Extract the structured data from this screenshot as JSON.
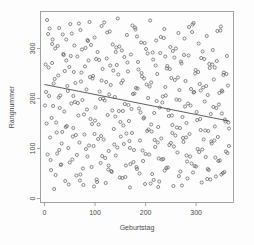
{
  "chart_data": {
    "type": "scatter",
    "title": "",
    "xlabel": "Geburtstag",
    "ylabel": "Rangnummer",
    "xlim": [
      -8,
      374
    ],
    "ylim": [
      -8,
      374
    ],
    "xticks": [
      0,
      100,
      200,
      300
    ],
    "xtick_labels": [
      "0",
      "100",
      "200",
      "300"
    ],
    "yticks": [
      0,
      100,
      200,
      300
    ],
    "ytick_labels": [
      "0",
      "100",
      "200",
      "300"
    ],
    "grid": false,
    "legend": null,
    "marker": "open-circle",
    "marker_color": "#5a5a5a",
    "frame_color": "#8c8c8c",
    "background_color": "#fdfdfd",
    "trend": {
      "type": "linear-regression",
      "color": "#4d4d4d",
      "x_start": 0,
      "y_start": 228,
      "x_end": 365,
      "y_end": 155,
      "slope": -0.2,
      "intercept": 228
    },
    "n_points": 366,
    "points": [
      [
        3,
        213
      ],
      [
        5,
        357
      ],
      [
        7,
        329
      ],
      [
        9,
        205
      ],
      [
        11,
        122
      ],
      [
        13,
        57
      ],
      [
        15,
        271
      ],
      [
        17,
        185
      ],
      [
        19,
        19
      ],
      [
        21,
        300
      ],
      [
        23,
        152
      ],
      [
        25,
        90
      ],
      [
        27,
        246
      ],
      [
        29,
        341
      ],
      [
        31,
        206
      ],
      [
        33,
        68
      ],
      [
        35,
        133
      ],
      [
        37,
        289
      ],
      [
        39,
        174
      ],
      [
        41,
        35
      ],
      [
        43,
        318
      ],
      [
        45,
        225
      ],
      [
        47,
        101
      ],
      [
        49,
        263
      ],
      [
        51,
        349
      ],
      [
        53,
        190
      ],
      [
        55,
        78
      ],
      [
        57,
        141
      ],
      [
        59,
        306
      ],
      [
        61,
        231
      ],
      [
        63,
        46
      ],
      [
        65,
        284
      ],
      [
        67,
        166
      ],
      [
        69,
        112
      ],
      [
        71,
        337
      ],
      [
        73,
        252
      ],
      [
        75,
        197
      ],
      [
        77,
        27
      ],
      [
        79,
        128
      ],
      [
        81,
        301
      ],
      [
        83,
        218
      ],
      [
        85,
        84
      ],
      [
        87,
        276
      ],
      [
        89,
        353
      ],
      [
        91,
        159
      ],
      [
        93,
        63
      ],
      [
        95,
        240
      ],
      [
        97,
        105
      ],
      [
        99,
        322
      ],
      [
        101,
        182
      ],
      [
        103,
        38
      ],
      [
        105,
        293
      ],
      [
        107,
        148
      ],
      [
        109,
        214
      ],
      [
        111,
        71
      ],
      [
        113,
        345
      ],
      [
        115,
        259
      ],
      [
        117,
        118
      ],
      [
        119,
        196
      ],
      [
        121,
        31
      ],
      [
        123,
        280
      ],
      [
        125,
        167
      ],
      [
        127,
        95
      ],
      [
        129,
        334
      ],
      [
        131,
        227
      ],
      [
        133,
        53
      ],
      [
        135,
        308
      ],
      [
        137,
        139
      ],
      [
        139,
        203
      ],
      [
        141,
        86
      ],
      [
        143,
        267
      ],
      [
        145,
        360
      ],
      [
        147,
        175
      ],
      [
        149,
        42
      ],
      [
        151,
        124
      ],
      [
        153,
        296
      ],
      [
        155,
        236
      ],
      [
        157,
        109
      ],
      [
        159,
        189
      ],
      [
        161,
        66
      ],
      [
        163,
        327
      ],
      [
        165,
        254
      ],
      [
        167,
        155
      ],
      [
        169,
        22
      ],
      [
        171,
        288
      ],
      [
        173,
        131
      ],
      [
        175,
        209
      ],
      [
        177,
        97
      ],
      [
        179,
        342
      ],
      [
        181,
        221
      ],
      [
        183,
        59
      ],
      [
        185,
        273
      ],
      [
        187,
        180
      ],
      [
        189,
        116
      ],
      [
        191,
        312
      ],
      [
        193,
        244
      ],
      [
        195,
        75
      ],
      [
        197,
        162
      ],
      [
        199,
        29
      ],
      [
        201,
        299
      ],
      [
        203,
        135
      ],
      [
        205,
        201
      ],
      [
        207,
        88
      ],
      [
        209,
        356
      ],
      [
        211,
        232
      ],
      [
        213,
        49
      ],
      [
        215,
        278
      ],
      [
        217,
        171
      ],
      [
        219,
        103
      ],
      [
        221,
        316
      ],
      [
        223,
        249
      ],
      [
        225,
        143
      ],
      [
        227,
        34
      ],
      [
        229,
        291
      ],
      [
        231,
        120
      ],
      [
        233,
        192
      ],
      [
        235,
        79
      ],
      [
        237,
        339
      ],
      [
        239,
        223
      ],
      [
        241,
        61
      ],
      [
        243,
        265
      ],
      [
        245,
        177
      ],
      [
        247,
        107
      ],
      [
        249,
        303
      ],
      [
        251,
        241
      ],
      [
        253,
        147
      ],
      [
        255,
        25
      ],
      [
        257,
        282
      ],
      [
        259,
        126
      ],
      [
        261,
        198
      ],
      [
        263,
        92
      ],
      [
        265,
        331
      ],
      [
        267,
        217
      ],
      [
        269,
        54
      ],
      [
        271,
        270
      ],
      [
        273,
        163
      ],
      [
        275,
        113
      ],
      [
        277,
        320
      ],
      [
        279,
        235
      ],
      [
        281,
        151
      ],
      [
        283,
        40
      ],
      [
        285,
        286
      ],
      [
        287,
        129
      ],
      [
        289,
        186
      ],
      [
        291,
        70
      ],
      [
        293,
        348
      ],
      [
        295,
        212
      ],
      [
        297,
        65
      ],
      [
        299,
        257
      ],
      [
        301,
        173
      ],
      [
        303,
        99
      ],
      [
        305,
        310
      ],
      [
        307,
        229
      ],
      [
        309,
        137
      ],
      [
        311,
        32
      ],
      [
        313,
        294
      ],
      [
        315,
        118
      ],
      [
        317,
        194
      ],
      [
        319,
        83
      ],
      [
        321,
        325
      ],
      [
        323,
        207
      ],
      [
        325,
        57
      ],
      [
        327,
        261
      ],
      [
        329,
        169
      ],
      [
        331,
        110
      ],
      [
        333,
        297
      ],
      [
        335,
        238
      ],
      [
        337,
        144
      ],
      [
        339,
        44
      ],
      [
        341,
        275
      ],
      [
        343,
        123
      ],
      [
        345,
        188
      ],
      [
        347,
        76
      ],
      [
        349,
        344
      ],
      [
        351,
        216
      ],
      [
        353,
        51
      ],
      [
        355,
        252
      ],
      [
        357,
        158
      ],
      [
        359,
        94
      ],
      [
        361,
        285
      ],
      [
        363,
        226
      ],
      [
        365,
        140
      ],
      [
        2,
        268
      ],
      [
        6,
        88
      ],
      [
        10,
        340
      ],
      [
        14,
        161
      ],
      [
        18,
        230
      ],
      [
        22,
        47
      ],
      [
        26,
        305
      ],
      [
        30,
        181
      ],
      [
        34,
        110
      ],
      [
        38,
        287
      ],
      [
        42,
        143
      ],
      [
        46,
        215
      ],
      [
        50,
        72
      ],
      [
        54,
        330
      ],
      [
        58,
        253
      ],
      [
        62,
        127
      ],
      [
        66,
        191
      ],
      [
        70,
        36
      ],
      [
        74,
        298
      ],
      [
        78,
        168
      ],
      [
        82,
        99
      ],
      [
        86,
        315
      ],
      [
        90,
        243
      ],
      [
        94,
        149
      ],
      [
        98,
        24
      ],
      [
        102,
        279
      ],
      [
        106,
        119
      ],
      [
        110,
        199
      ],
      [
        114,
        85
      ],
      [
        118,
        352
      ],
      [
        122,
        233
      ],
      [
        126,
        58
      ],
      [
        130,
        266
      ],
      [
        134,
        176
      ],
      [
        138,
        108
      ],
      [
        142,
        302
      ],
      [
        146,
        248
      ],
      [
        150,
        153
      ],
      [
        154,
        41
      ],
      [
        158,
        283
      ],
      [
        162,
        130
      ],
      [
        166,
        187
      ],
      [
        170,
        69
      ],
      [
        174,
        346
      ],
      [
        178,
        210
      ],
      [
        182,
        63
      ],
      [
        186,
        258
      ],
      [
        190,
        172
      ],
      [
        194,
        96
      ],
      [
        198,
        311
      ],
      [
        202,
        228
      ],
      [
        206,
        138
      ],
      [
        210,
        30
      ],
      [
        214,
        292
      ],
      [
        218,
        117
      ],
      [
        222,
        195
      ],
      [
        226,
        80
      ],
      [
        230,
        323
      ],
      [
        234,
        204
      ],
      [
        238,
        56
      ],
      [
        242,
        260
      ],
      [
        246,
        165
      ],
      [
        250,
        111
      ],
      [
        254,
        295
      ],
      [
        258,
        237
      ],
      [
        262,
        142
      ],
      [
        266,
        45
      ],
      [
        270,
        274
      ],
      [
        274,
        121
      ],
      [
        278,
        184
      ],
      [
        282,
        74
      ],
      [
        286,
        343
      ],
      [
        290,
        219
      ],
      [
        294,
        52
      ],
      [
        298,
        250
      ],
      [
        302,
        157
      ],
      [
        306,
        93
      ],
      [
        310,
        281
      ],
      [
        314,
        222
      ],
      [
        318,
        136
      ],
      [
        322,
        39
      ],
      [
        326,
        269
      ],
      [
        330,
        114
      ],
      [
        334,
        183
      ],
      [
        338,
        82
      ],
      [
        342,
        335
      ],
      [
        346,
        211
      ],
      [
        350,
        48
      ],
      [
        354,
        247
      ],
      [
        358,
        154
      ],
      [
        362,
        91
      ],
      [
        4,
        150
      ],
      [
        8,
        262
      ],
      [
        12,
        77
      ],
      [
        16,
        318
      ],
      [
        20,
        239
      ],
      [
        24,
        132
      ],
      [
        28,
        202
      ],
      [
        32,
        67
      ],
      [
        36,
        328
      ],
      [
        40,
        255
      ],
      [
        44,
        145
      ],
      [
        48,
        28
      ],
      [
        52,
        285
      ],
      [
        56,
        124
      ],
      [
        60,
        193
      ],
      [
        64,
        87
      ],
      [
        68,
        350
      ],
      [
        72,
        234
      ],
      [
        76,
        60
      ],
      [
        80,
        264
      ],
      [
        84,
        178
      ],
      [
        88,
        106
      ],
      [
        92,
        307
      ],
      [
        96,
        245
      ],
      [
        100,
        156
      ],
      [
        104,
        33
      ],
      [
        108,
        277
      ],
      [
        112,
        125
      ],
      [
        116,
        200
      ],
      [
        120,
        81
      ],
      [
        124,
        332
      ],
      [
        128,
        208
      ],
      [
        132,
        55
      ],
      [
        136,
        256
      ],
      [
        140,
        164
      ],
      [
        144,
        102
      ],
      [
        148,
        304
      ],
      [
        152,
        231
      ],
      [
        156,
        146
      ],
      [
        160,
        43
      ],
      [
        164,
        272
      ],
      [
        168,
        115
      ],
      [
        172,
        179
      ],
      [
        176,
        73
      ],
      [
        180,
        338
      ],
      [
        184,
        220
      ],
      [
        188,
        50
      ],
      [
        192,
        251
      ],
      [
        196,
        160
      ],
      [
        200,
        89
      ],
      [
        204,
        290
      ],
      [
        208,
        224
      ],
      [
        212,
        134
      ],
      [
        216,
        37
      ],
      [
        220,
        266
      ],
      [
        224,
        112
      ],
      [
        228,
        182
      ],
      [
        232,
        78
      ],
      [
        236,
        321
      ],
      [
        240,
        206
      ],
      [
        244,
        62
      ],
      [
        248,
        259
      ],
      [
        252,
        166
      ],
      [
        256,
        104
      ],
      [
        260,
        300
      ],
      [
        264,
        242
      ],
      [
        268,
        141
      ],
      [
        272,
        26
      ],
      [
        276,
        287
      ],
      [
        280,
        122
      ],
      [
        284,
        190
      ],
      [
        288,
        84
      ],
      [
        292,
        333
      ],
      [
        296,
        213
      ],
      [
        300,
        64
      ],
      [
        304,
        253
      ],
      [
        308,
        159
      ],
      [
        312,
        98
      ],
      [
        316,
        279
      ],
      [
        320,
        225
      ],
      [
        324,
        135
      ],
      [
        328,
        38
      ],
      [
        332,
        268
      ],
      [
        336,
        116
      ],
      [
        340,
        181
      ],
      [
        344,
        75
      ],
      [
        348,
        336
      ],
      [
        352,
        214
      ],
      [
        356,
        53
      ],
      [
        360,
        249
      ],
      [
        364,
        152
      ],
      [
        1,
        186
      ],
      [
        15,
        309
      ],
      [
        29,
        97
      ],
      [
        43,
        276
      ],
      [
        57,
        205
      ],
      [
        71,
        48
      ],
      [
        85,
        317
      ],
      [
        99,
        129
      ],
      [
        113,
        236
      ],
      [
        127,
        66
      ],
      [
        141,
        293
      ],
      [
        155,
        175
      ],
      [
        169,
        101
      ],
      [
        183,
        324
      ],
      [
        197,
        240
      ],
      [
        211,
        148
      ],
      [
        225,
        23
      ],
      [
        239,
        284
      ],
      [
        253,
        131
      ],
      [
        267,
        197
      ],
      [
        281,
        86
      ],
      [
        295,
        351
      ],
      [
        309,
        216
      ],
      [
        323,
        59
      ],
      [
        337,
        262
      ],
      [
        351,
        170
      ],
      [
        365,
        105
      ]
    ]
  }
}
